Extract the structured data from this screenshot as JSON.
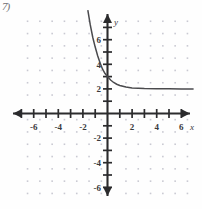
{
  "corner_mark": "7)",
  "chart_data": {
    "type": "line",
    "title": "",
    "xlabel": "x",
    "ylabel": "y",
    "xlim": [
      -7.5,
      7.5
    ],
    "ylim": [
      -7.5,
      7.5
    ],
    "grid": true,
    "grid_style": "dotted",
    "legend": null,
    "axis_arrows": [
      "left",
      "right",
      "up",
      "down"
    ],
    "x_tick_labels": [
      "-6",
      "-4",
      "-2",
      "2",
      "4",
      "6"
    ],
    "x_tick_values": [
      -6,
      -4,
      -2,
      2,
      4,
      6
    ],
    "y_tick_labels": [
      "6",
      "4",
      "2",
      "-2",
      "-4",
      "-6"
    ],
    "y_tick_values": [
      6,
      4,
      2,
      -2,
      -4,
      -6
    ],
    "minor_tick_interval": 1,
    "series": [
      {
        "name": "exponential decay",
        "description": "decreasing exponential with horizontal asymptote y = 2",
        "asymptote": 2,
        "y_intercept": 3,
        "points": [
          [
            -1.6,
            8.4
          ],
          [
            -1.4,
            7.2
          ],
          [
            -1.2,
            6.2
          ],
          [
            -1.0,
            5.4
          ],
          [
            -0.8,
            4.7
          ],
          [
            -0.6,
            4.1
          ],
          [
            -0.4,
            3.6
          ],
          [
            -0.2,
            3.25
          ],
          [
            0.0,
            3.0
          ],
          [
            0.25,
            2.72
          ],
          [
            0.5,
            2.52
          ],
          [
            0.75,
            2.38
          ],
          [
            1.0,
            2.28
          ],
          [
            1.5,
            2.15
          ],
          [
            2.0,
            2.08
          ],
          [
            3.0,
            2.03
          ],
          [
            4.0,
            2.01
          ],
          [
            5.0,
            2.005
          ],
          [
            6.0,
            2.0
          ],
          [
            7.0,
            2.0
          ]
        ]
      }
    ],
    "colors": {
      "curve": "#4a4a4d",
      "axis": "#2b2b2d",
      "grid_dot": "#c9c9d2",
      "label": "#3a3a3c",
      "background": "#fefefe"
    }
  }
}
